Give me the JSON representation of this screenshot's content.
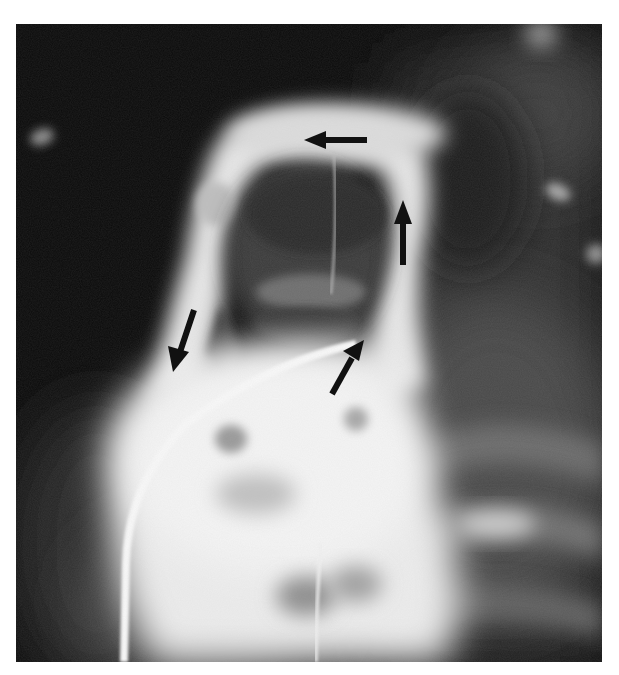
{
  "figure": {
    "kind": "radiograph",
    "colors": {
      "background": "#0a0a0a",
      "contrast_bright": "#f2f2f2",
      "lung_field": "#3a3a3a",
      "arrow": "#111111",
      "page": "#ffffff"
    },
    "annotations": [
      {
        "id": "arrow-left",
        "direction": "left",
        "label": ""
      },
      {
        "id": "arrow-up",
        "direction": "up",
        "label": ""
      },
      {
        "id": "arrow-down-left",
        "direction": "down-left",
        "label": ""
      },
      {
        "id": "arrow-up-right",
        "direction": "up-right",
        "label": ""
      }
    ]
  }
}
